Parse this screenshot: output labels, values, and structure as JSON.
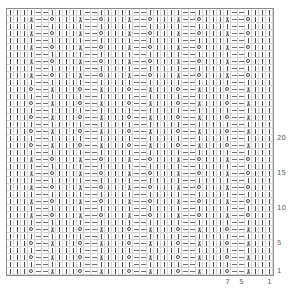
{
  "chart_data": {
    "type": "table",
    "xlabel": "Stitches",
    "ylabel": "Rows",
    "grid": true,
    "columns": 38,
    "rows": 38,
    "cell_size_px": 7,
    "repeat_width": 7,
    "repeat_label": "7-stitch repeat",
    "legend": [
      {
        "symbol": "|",
        "name": "knit-stitch",
        "code": "K"
      },
      {
        "symbol": "–",
        "name": "purl-or-no-stitch",
        "code": "-"
      },
      {
        "symbol": "O",
        "name": "yarn-over",
        "code": "O"
      },
      {
        "symbol": "λ",
        "name": "decrease",
        "code": "A"
      }
    ],
    "row_tick_labels": [
      "20",
      "15",
      "10",
      "5",
      "1"
    ],
    "row_tick_rows_from_bottom": [
      20,
      15,
      10,
      5,
      1
    ],
    "col_tick_labels": [
      "7",
      "5",
      "1"
    ],
    "col_tick_cols_from_right": [
      7,
      5,
      1
    ],
    "row_patterns": {
      "plain_left": "|||| --|",
      "plain": "||||--|",
      "dec_left": "|||A--O",
      "dec_right": "|||O--A"
    },
    "rows_top_to_bottom": [
      "||||--|||||--|||||--|||||--|||||--|||||--||",
      "|||A--O|||A--O|||A--O|||A--O|||A--O|||A--O||",
      "||||--|||||--|||||--|||||--|||||--|||||--||",
      "|||A--O|||A--O|||A--O|||A--O|||A--O|||A--O||",
      "||||--|||||--|||||--|||||--|||||--|||||--||",
      "|||A--O|||A--O|||A--O|||A--O|||A--O|||A--O||",
      "||||--|||||--|||||--|||||--|||||--|||||--||",
      "|||A--O|||A--O|||A--O|||A--O|||A--O|||A--O||",
      "||||--|||||--|||||--|||||--|||||--|||||--||",
      "|||A--O|||A--O|||A--O|||A--O|||A--O|||A--O||",
      "||||--|||||--|||||--|||||--|||||--|||||--||",
      "|||O--A|||O--A|||O--A|||O--A|||O--A|||O--A||",
      "||||--|||||--|||||--|||||--|||||--|||||--||",
      "|||O--A|||O--A|||O--A|||O--A|||O--A|||O--A||",
      "||||--|||||--|||||--|||||--|||||--|||||--||",
      "|||O--A|||O--A|||O--A|||O--A|||O--A|||O--A||",
      "||||--|||||--|||||--|||||--|||||--|||||--||",
      "|||O--A|||O--A|||O--A|||O--A|||O--A|||O--A||",
      "||||--|||||--|||||--|||||--|||||--|||||--||",
      "|||O--A|||O--A|||O--A|||O--A|||O--A|||O--A||",
      "||||--|||||--|||||--|||||--|||||--|||||--||",
      "|||A--O|||A--O|||A--O|||A--O|||A--O|||A--O||",
      "||||--|||||--|||||--|||||--|||||--|||||--||",
      "|||A--O|||A--O|||A--O|||A--O|||A--O|||A--O||",
      "||||--|||||--|||||--|||||--|||||--|||||--||",
      "|||A--O|||A--O|||A--O|||A--O|||A--O|||A--O||",
      "||||--|||||--|||||--|||||--|||||--|||||--||",
      "|||A--O|||A--O|||A--O|||A--O|||A--O|||A--O||",
      "||||--|||||--|||||--|||||--|||||--|||||--||",
      "|||A--O|||A--O|||A--O|||A--O|||A--O|||A--O||",
      "||||--|||||--|||||--|||||--|||||--|||||--||",
      "|||O--A|||O--A|||O--A|||O--A|||O--A|||O--A||",
      "||||--|||||--|||||--|||||--|||||--|||||--||",
      "|||O--A|||O--A|||O--A|||O--A|||O--A|||O--A||",
      "||||--|||||--|||||--|||||--|||||--|||||--||",
      "|||O--A|||O--A|||O--A|||O--A|||O--A|||O--A||",
      "||||--|||||--|||||--|||||--|||||--|||||--||",
      "|||O--A|||O--A|||O--A|||O--A|||O--A|||O--A||"
    ]
  }
}
